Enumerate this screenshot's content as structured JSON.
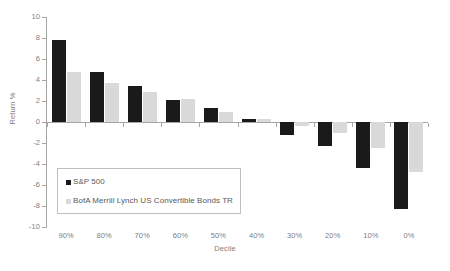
{
  "chart_data": {
    "type": "bar",
    "title": "",
    "xlabel": "Decile",
    "ylabel": "Return %",
    "categories": [
      "90%",
      "80%",
      "70%",
      "60%",
      "50%",
      "40%",
      "30%",
      "20%",
      "10%",
      "0%"
    ],
    "series": [
      {
        "name": "S&P 500",
        "color": "#1a1a1a",
        "values": [
          7.8,
          4.8,
          3.4,
          2.1,
          1.3,
          0.3,
          -1.2,
          -2.3,
          -4.4,
          -8.3
        ]
      },
      {
        "name": "BofA Merrill Lynch US Convertible Bonds TR",
        "color": "#d9d9d9",
        "values": [
          4.8,
          3.7,
          2.9,
          2.2,
          1.0,
          0.3,
          -0.4,
          -1.0,
          -2.5,
          -4.8
        ]
      }
    ],
    "ylim": [
      -10,
      10
    ],
    "yticks": [
      10,
      8,
      6,
      4,
      2,
      0,
      -2,
      -4,
      -6,
      -8,
      -10
    ],
    "ytick_labels": [
      "10",
      "8",
      "6",
      "4",
      "2",
      "0",
      "-2",
      "-4",
      "-6",
      "-8",
      "-10"
    ],
    "grid": false,
    "legend_position": "inside-lower-left"
  },
  "legend": {
    "items": [
      {
        "label": "S&P 500"
      },
      {
        "label": "BofA Merrill Lynch US Convertible Bonds TR"
      }
    ]
  }
}
